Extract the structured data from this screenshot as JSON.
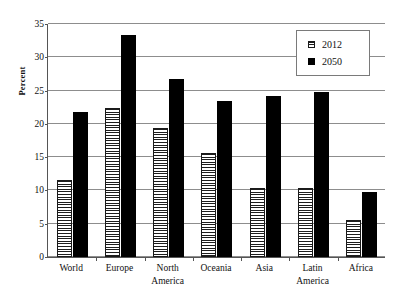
{
  "chart_data": {
    "type": "bar",
    "title": "",
    "xlabel": "",
    "ylabel": "Percent",
    "ylim": [
      0,
      35
    ],
    "ytick_step": 5,
    "yticks": [
      0,
      5,
      10,
      15,
      20,
      25,
      30,
      35
    ],
    "grid": true,
    "legend_position": "top-right",
    "categories": [
      "World",
      "Europe",
      "North America",
      "Oceania",
      "Asia",
      "Latin America",
      "Africa"
    ],
    "series": [
      {
        "name": "2012",
        "fill": "horizontal-hatch",
        "color": "#1d1d1d",
        "values": [
          11.5,
          22.4,
          19.4,
          15.6,
          10.4,
          10.4,
          5.5
        ]
      },
      {
        "name": "2050",
        "fill": "solid",
        "color": "#000000",
        "values": [
          21.8,
          33.4,
          26.8,
          23.4,
          24.2,
          24.8,
          9.8
        ]
      }
    ]
  },
  "legend": {
    "entries": [
      {
        "label": "2012"
      },
      {
        "label": "2050"
      }
    ]
  },
  "colors": {
    "series_2012": "#1d1d1d",
    "series_2050": "#000000",
    "gridline": "#8d8d8d",
    "axis": "#555555",
    "background": "#ffffff"
  }
}
